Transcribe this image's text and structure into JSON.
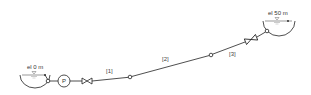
{
  "diagram": {
    "type": "pipe-network-schematic",
    "reservoirs": [
      {
        "id": "left",
        "label": "el 0 m"
      },
      {
        "id": "right",
        "label": "el 50 m"
      }
    ],
    "pump": {
      "label": "P"
    },
    "pipes": [
      {
        "label": "[1]"
      },
      {
        "label": "[2]"
      },
      {
        "label": "[3]"
      }
    ],
    "valves": 2,
    "colors": {
      "line": "#222222",
      "water": "#999999",
      "background": "#ffffff"
    }
  }
}
